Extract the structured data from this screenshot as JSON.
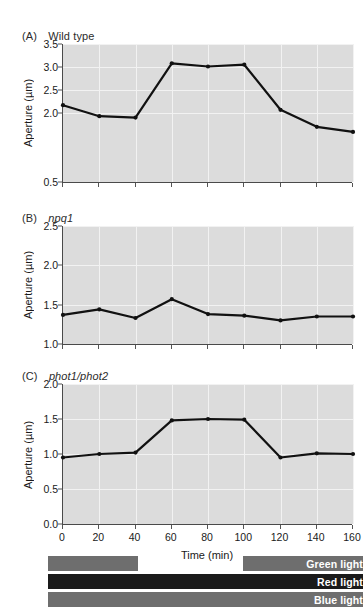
{
  "figure": {
    "panels": [
      {
        "tag": "(A)",
        "name": "Wild type",
        "italic": false,
        "ylabel": "Aperture (µm)"
      },
      {
        "tag": "(B)",
        "name": "npq1",
        "italic": true,
        "ylabel": "Aperture (µm)"
      },
      {
        "tag": "(C)",
        "name": "phot1/phot2",
        "italic": true,
        "ylabel": "Aperture (µm)"
      }
    ],
    "xlabel": "Time (min)",
    "legend": {
      "bars": [
        {
          "label": "Green light",
          "color": "#6e6e6e"
        },
        {
          "label": "Red light",
          "color": "#1a1a1a"
        },
        {
          "label": "Blue light",
          "color": "#6e6e6e"
        }
      ]
    }
  },
  "chart_data": [
    {
      "type": "line",
      "title": "(A) Wild type",
      "xlabel": "Time (min)",
      "ylabel": "Aperture (µm)",
      "x": [
        0,
        20,
        40,
        60,
        80,
        100,
        120,
        140,
        160
      ],
      "values": [
        2.17,
        1.93,
        1.9,
        3.08,
        3.01,
        3.05,
        2.07,
        1.7,
        1.59
      ],
      "xlim": [
        0,
        160
      ],
      "ylim": [
        0.5,
        3.5
      ],
      "yticks": [
        0.5,
        2.0,
        2.5,
        3.0,
        3.5
      ],
      "xticks": [
        0,
        20,
        40,
        60,
        80,
        100,
        120,
        140,
        160
      ],
      "grid": true,
      "legend_position": "none",
      "marker": "circle",
      "color": "#111111"
    },
    {
      "type": "line",
      "title": "(B) npq1",
      "xlabel": "Time (min)",
      "ylabel": "Aperture (µm)",
      "x": [
        0,
        20,
        40,
        60,
        80,
        100,
        120,
        140,
        160
      ],
      "values": [
        1.37,
        1.44,
        1.33,
        1.57,
        1.38,
        1.36,
        1.3,
        1.35,
        1.35
      ],
      "xlim": [
        0,
        160
      ],
      "ylim": [
        1.0,
        2.5
      ],
      "yticks": [
        1.0,
        1.5,
        2.0,
        2.5
      ],
      "xticks": [
        0,
        20,
        40,
        60,
        80,
        100,
        120,
        140,
        160
      ],
      "grid": true,
      "legend_position": "none",
      "marker": "circle",
      "color": "#111111"
    },
    {
      "type": "line",
      "title": "(C) phot1/phot2",
      "xlabel": "Time (min)",
      "ylabel": "Aperture (µm)",
      "x": [
        0,
        20,
        40,
        60,
        80,
        100,
        120,
        140,
        160
      ],
      "values": [
        0.95,
        1.0,
        1.02,
        1.48,
        1.5,
        1.49,
        0.95,
        1.01,
        1.0
      ],
      "xlim": [
        0,
        160
      ],
      "ylim": [
        0.0,
        2.0
      ],
      "yticks": [
        0.0,
        0.5,
        1.0,
        1.5,
        2.0
      ],
      "xticks": [
        0,
        20,
        40,
        60,
        80,
        100,
        120,
        140,
        160
      ],
      "grid": true,
      "legend_position": "none",
      "marker": "circle",
      "color": "#111111"
    }
  ],
  "treatment_timeline": {
    "xlim": [
      0,
      160
    ],
    "bars": [
      {
        "label": "Green light",
        "segments": [
          [
            -8,
            42
          ],
          [
            100,
            166
          ]
        ],
        "color": "#6e6e6e"
      },
      {
        "label": "Red light",
        "segments": [
          [
            -8,
            166
          ]
        ],
        "color": "#1a1a1a"
      },
      {
        "label": "Blue light",
        "segments": [
          [
            -8,
            166
          ]
        ],
        "color": "#6e6e6e"
      }
    ]
  }
}
